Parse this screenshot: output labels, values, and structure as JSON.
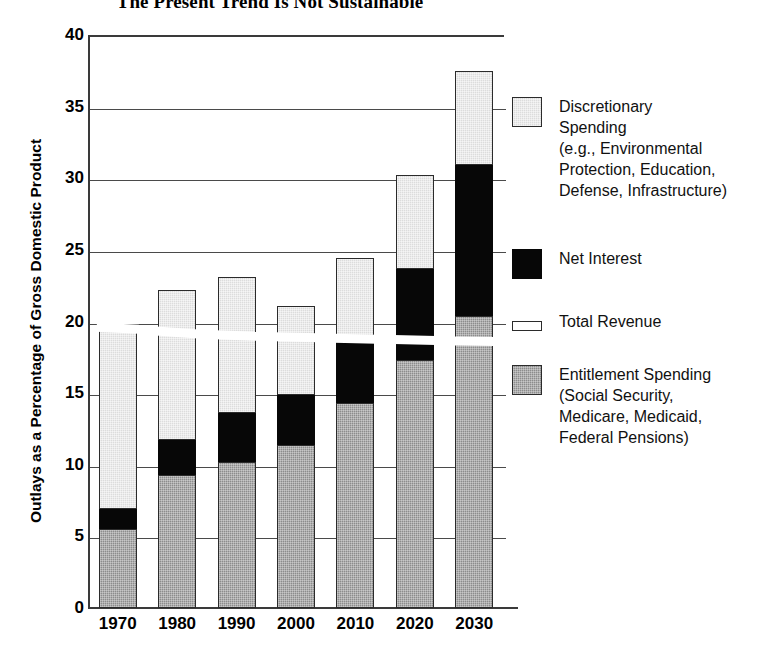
{
  "chart_data": {
    "type": "bar",
    "subtype": "stacked-bar-with-line",
    "title": "The Present Trend Is Not Sustainable",
    "xlabel": "",
    "ylabel": "Outlays as a Percentage of Gross Domestic Product",
    "categories": [
      "1970",
      "1980",
      "1990",
      "2000",
      "2010",
      "2020",
      "2030"
    ],
    "ylim": [
      0,
      40
    ],
    "yticks": [
      0,
      5,
      10,
      15,
      20,
      25,
      30,
      35,
      40
    ],
    "ytick_labels": [
      "0",
      "5",
      "10",
      "15",
      "20",
      "25",
      "30",
      "35",
      "40"
    ],
    "grid": true,
    "legend_position": "right",
    "series": [
      {
        "name": "Entitlement Spending",
        "legend_label": "Entitlement Spending\n(Social Security,\nMedicare, Medicaid,\nFederal Pensions)",
        "color": "#8c8c8c",
        "values": [
          5.5,
          9.3,
          10.2,
          11.4,
          14.3,
          17.3,
          20.4
        ]
      },
      {
        "name": "Net Interest",
        "legend_label": "Net Interest",
        "color": "#070707",
        "values": [
          1.4,
          2.4,
          3.4,
          3.5,
          4.2,
          6.4,
          10.5
        ]
      },
      {
        "name": "Discretionary Spending",
        "legend_label": "Discretionary\nSpending\n(e.g., Environmental\nProtection, Education,\nDefense, Infrastructure)",
        "color": "#dcdcdc",
        "values": [
          12.8,
          10.5,
          9.5,
          6.2,
          5.9,
          6.5,
          6.6
        ]
      }
    ],
    "totals": [
      19.7,
      22.2,
      23.1,
      21.1,
      24.4,
      30.2,
      37.5
    ],
    "revenue_line": {
      "name": "Total Revenue",
      "legend_label": "Total Revenue",
      "color": "#ffffff",
      "values": [
        19.6,
        19.2,
        19.0,
        18.9,
        18.8,
        18.7,
        18.6
      ]
    }
  },
  "legend": {
    "entries": [
      {
        "swatch": "discretionary",
        "label": "Discretionary\nSpending\n(e.g., Environmental\nProtection, Education,\nDefense, Infrastructure)"
      },
      {
        "swatch": "interest",
        "label": "Net Interest"
      },
      {
        "swatch": "revenue",
        "label": "Total Revenue"
      },
      {
        "swatch": "entitlement",
        "label": "Entitlement Spending\n(Social Security,\nMedicare, Medicaid,\nFederal Pensions)"
      }
    ]
  }
}
